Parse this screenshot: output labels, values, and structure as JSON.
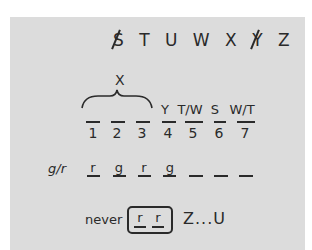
{
  "top_letters": [
    {
      "char": "S",
      "struck": true
    },
    {
      "char": "T",
      "struck": false
    },
    {
      "char": "U",
      "struck": false
    },
    {
      "char": "W",
      "struck": false
    },
    {
      "char": "X",
      "struck": false
    },
    {
      "char": "Y",
      "struck": true
    },
    {
      "char": "Z",
      "struck": false
    }
  ],
  "brace_label": "X",
  "positions": [
    {
      "number": "1",
      "value": ""
    },
    {
      "number": "2",
      "value": ""
    },
    {
      "number": "3",
      "value": ""
    },
    {
      "number": "4",
      "value": "Y"
    },
    {
      "number": "5",
      "value": "T/W"
    },
    {
      "number": "6",
      "value": "S"
    },
    {
      "number": "7",
      "value": "W/T"
    }
  ],
  "gr_row": {
    "label": "g/r",
    "values": [
      "r",
      "g",
      "r",
      "g",
      "",
      "",
      ""
    ]
  },
  "rule": {
    "prefix": "never",
    "boxed": [
      "r",
      "r"
    ],
    "suffix": "Z...U"
  }
}
